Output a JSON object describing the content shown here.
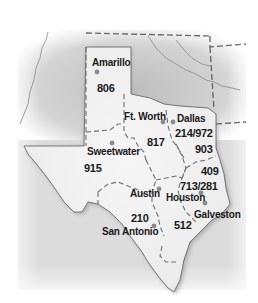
{
  "map": {
    "title": "Texas Area Codes",
    "colors": {
      "background": "#ffffff",
      "surround": "#cfcfcf",
      "texas_fill": "#efefef",
      "border": "#707070",
      "dot": "#8a8a8a",
      "text": "#1a1a1a"
    },
    "cities": [
      {
        "name": "Amarillo",
        "x": 96,
        "y": 65,
        "dot_x": 96,
        "dot_y": 72
      },
      {
        "name": "Ft. Worth",
        "x": 124,
        "y": 119,
        "dot_x": 163,
        "dot_y": 122
      },
      {
        "name": "Dallas",
        "x": 176,
        "y": 121,
        "dot_x": 173,
        "dot_y": 122
      },
      {
        "name": "Sweetwater",
        "x": 87,
        "y": 153,
        "dot_x": 112,
        "dot_y": 142
      },
      {
        "name": "Austin",
        "x": 130,
        "y": 196,
        "dot_x": 159,
        "dot_y": 189
      },
      {
        "name": "Houston",
        "x": 166,
        "y": 200,
        "dot_x": 201,
        "dot_y": 193
      },
      {
        "name": "Galveston",
        "x": 194,
        "y": 217,
        "dot_x": 205,
        "dot_y": 204
      },
      {
        "name": "San Antonio",
        "x": 102,
        "y": 235,
        "dot_x": 154,
        "dot_y": 225
      }
    ],
    "area_codes": [
      {
        "code": "806",
        "x": 96,
        "y": 92
      },
      {
        "code": "817",
        "x": 147,
        "y": 146
      },
      {
        "code": "214/972",
        "x": 175,
        "y": 136
      },
      {
        "code": "903",
        "x": 195,
        "y": 152
      },
      {
        "code": "915",
        "x": 84,
        "y": 171
      },
      {
        "code": "409",
        "x": 201,
        "y": 174
      },
      {
        "code": "713/281",
        "x": 180,
        "y": 189
      },
      {
        "code": "210",
        "x": 131,
        "y": 221
      },
      {
        "code": "512",
        "x": 174,
        "y": 228
      }
    ]
  }
}
